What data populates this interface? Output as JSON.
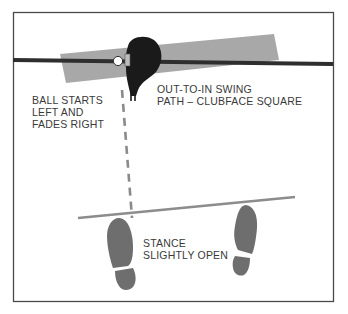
{
  "diagram": {
    "type": "golf swing instruction diagram",
    "labels": {
      "ball_flight": {
        "lines": [
          "BALL STARTS",
          "LEFT AND",
          "FADES RIGHT"
        ]
      },
      "swing_path": {
        "lines": [
          "OUT-TO-IN SWING",
          "PATH – CLUBFACE SQUARE"
        ]
      },
      "stance": {
        "lines": [
          "STANCE",
          "SLIGHTLY OPEN"
        ]
      }
    },
    "elements": [
      "frame",
      "target-line",
      "swing-path-band",
      "golf-ball",
      "club-head",
      "ball-flight-dashed-line",
      "stance-line",
      "left-footprint",
      "right-footprint"
    ],
    "colors": {
      "frame": "#4a4a4a",
      "target_line": "#2e2e2e",
      "swing_band": "#a8a8a8",
      "club_head": "#1a1a1a",
      "dashed_line": "#8a8a8a",
      "stance_line": "#8c8c8c",
      "footprint": "#6e6e6e",
      "text": "#3a3a3a"
    }
  }
}
